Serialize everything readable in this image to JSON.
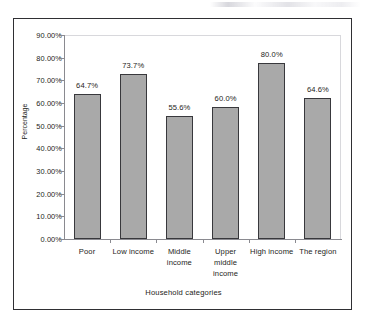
{
  "chart_data": {
    "type": "bar",
    "title": "",
    "xlabel": "Household categories",
    "ylabel": "Percentage",
    "categories": [
      "Poor",
      "Low income",
      "Middle income",
      "Upper middle income",
      "High income",
      "The region"
    ],
    "values": [
      64.7,
      73.7,
      55.6,
      60.0,
      80.0,
      64.6
    ],
    "data_labels": [
      "64.7%",
      "73.7%",
      "55.6%",
      "60.0%",
      "80.0%",
      "64.6%"
    ],
    "ylim": [
      0,
      90
    ],
    "ytick_labels": [
      "90.00%",
      "80.00%",
      "70.00%",
      "60.00%",
      "50.00%",
      "40.00%",
      "30.00%",
      "20.00%",
      "10.00%",
      "0.00%"
    ],
    "ytick_values": [
      90,
      80,
      70,
      60,
      50,
      40,
      30,
      20,
      10,
      0
    ],
    "grid": false,
    "legend": false,
    "series_color": "#a9a9a9",
    "series_border_color": "#38383c",
    "category_lines": [
      [
        "Poor"
      ],
      [
        "Low income"
      ],
      [
        "Middle",
        "income"
      ],
      [
        "Upper",
        "middle",
        "income"
      ],
      [
        "High income"
      ],
      [
        "The region"
      ]
    ]
  }
}
